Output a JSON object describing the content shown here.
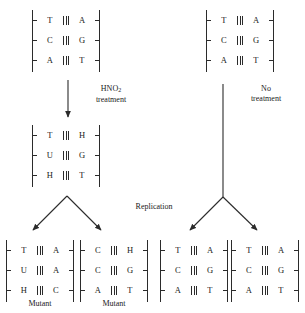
{
  "figure": {
    "labels": {
      "hno2_treatment_line1": "HNO",
      "hno2_treatment_sub": "2",
      "hno2_treatment_line2": "treatment",
      "no_treatment_line1": "No",
      "no_treatment_line2": "treatment",
      "replication": "Replication",
      "mutant_left": "Mutant",
      "mutant_right": "Mutant"
    },
    "ladders": [
      {
        "id": "top-left-original-dna",
        "caption": "",
        "pairs": [
          {
            "left": "T",
            "bonds": 3,
            "right": "A"
          },
          {
            "left": "C",
            "bonds": 3,
            "right": "G"
          },
          {
            "left": "A",
            "bonds": 3,
            "right": "T"
          }
        ]
      },
      {
        "id": "top-right-untreated-dna",
        "caption": "",
        "pairs": [
          {
            "left": "T",
            "bonds": 3,
            "right": "A"
          },
          {
            "left": "C",
            "bonds": 3,
            "right": "G"
          },
          {
            "left": "A",
            "bonds": 3,
            "right": "T"
          }
        ]
      },
      {
        "id": "middle-left-deaminated-dna",
        "caption": "",
        "pairs": [
          {
            "left": "T",
            "bonds": 3,
            "right": "H"
          },
          {
            "left": "U",
            "bonds": 3,
            "right": "G"
          },
          {
            "left": "H",
            "bonds": 3,
            "right": "T"
          }
        ]
      },
      {
        "id": "bottom-daughter-1-mutant",
        "caption": "Mutant",
        "pairs": [
          {
            "left": "T",
            "bonds": 3,
            "right": "A"
          },
          {
            "left": "U",
            "bonds": 3,
            "right": "A"
          },
          {
            "left": "H",
            "bonds": 3,
            "right": "C"
          }
        ]
      },
      {
        "id": "bottom-daughter-2-mutant",
        "caption": "Mutant",
        "pairs": [
          {
            "left": "C",
            "bonds": 3,
            "right": "H"
          },
          {
            "left": "C",
            "bonds": 3,
            "right": "G"
          },
          {
            "left": "A",
            "bonds": 3,
            "right": "T"
          }
        ]
      },
      {
        "id": "bottom-daughter-3-wildtype",
        "caption": "",
        "pairs": [
          {
            "left": "T",
            "bonds": 3,
            "right": "A"
          },
          {
            "left": "C",
            "bonds": 3,
            "right": "G"
          },
          {
            "left": "A",
            "bonds": 3,
            "right": "T"
          }
        ]
      },
      {
        "id": "bottom-daughter-4-wildtype",
        "caption": "",
        "pairs": [
          {
            "left": "T",
            "bonds": 3,
            "right": "A"
          },
          {
            "left": "C",
            "bonds": 3,
            "right": "G"
          },
          {
            "left": "A",
            "bonds": 3,
            "right": "T"
          }
        ]
      }
    ],
    "colors": {
      "ink": "#1a1a1a",
      "line": "#2b2b2b",
      "background": "#ffffff"
    }
  }
}
